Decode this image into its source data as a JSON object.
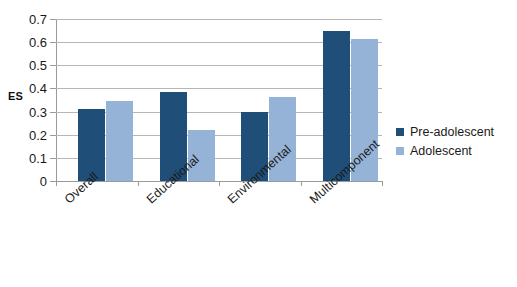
{
  "chart_data": {
    "type": "bar",
    "title": "",
    "xlabel": "",
    "ylabel": "ES",
    "ylim": [
      0,
      0.7
    ],
    "ytick_labels": [
      "0.7",
      "0.6",
      "0.5",
      "0.4",
      "0.3",
      "0.2",
      "0.1",
      "0"
    ],
    "ytick_values": [
      0.7,
      0.6,
      0.5,
      0.4,
      0.3,
      0.2,
      0.1,
      0
    ],
    "grid": true,
    "legend_position": "right",
    "categories": [
      "Overall",
      "Educational",
      "Environmental",
      "Multicomponent"
    ],
    "series": [
      {
        "name": "Pre-adolescent",
        "color": "#1F4E79",
        "values": [
          0.31,
          0.385,
          0.3,
          0.65
        ]
      },
      {
        "name": "Adolescent",
        "color": "#95B3D7",
        "values": [
          0.345,
          0.22,
          0.365,
          0.615
        ]
      }
    ]
  },
  "axis": {
    "y_title": "ES"
  },
  "legend": {
    "items": [
      {
        "label": "Pre-adolescent",
        "color": "#1F4E79"
      },
      {
        "label": "Adolescent",
        "color": "#95B3D7"
      }
    ]
  },
  "title_strip": {
    "text": ""
  }
}
